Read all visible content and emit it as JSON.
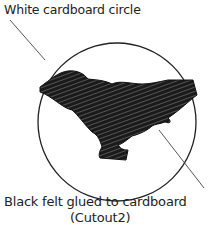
{
  "diagram": {
    "labels": {
      "circle": "White cardboard circle",
      "felt": "Black felt glued to cardboard",
      "cutout": "(Cutout2)"
    },
    "colors": {
      "line": "#222222",
      "felt": "#1a1a1a",
      "background": "#ffffff"
    }
  }
}
